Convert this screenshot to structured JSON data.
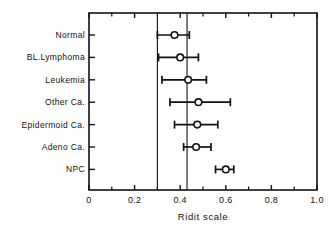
{
  "chart_data": {
    "type": "scatter",
    "title": "",
    "xlabel": "Ridit scale",
    "ylabel": "",
    "xlim": [
      0,
      1.0
    ],
    "xticks": [
      0,
      0.2,
      0.4,
      0.6,
      0.8,
      1.0
    ],
    "xtick_labels": [
      "0",
      "0.2",
      "0.4",
      "0.6",
      "0.8",
      "1.0"
    ],
    "xminor_ticks": [
      0.1,
      0.3,
      0.5,
      0.7,
      0.9
    ],
    "grid": false,
    "legend": "none",
    "frame": "box",
    "orientation": "horizontal",
    "marker": "open-circle",
    "categories": [
      "Normal",
      "BL.Lymphoma",
      "Leukemia",
      "Other Ca.",
      "Epidermoid Ca.",
      "Adeno Ca.",
      "NPC"
    ],
    "values": [
      0.375,
      0.4,
      0.435,
      0.48,
      0.475,
      0.47,
      0.6
    ],
    "ci_low": [
      0.3,
      0.305,
      0.32,
      0.355,
      0.375,
      0.415,
      0.555
    ],
    "ci_high": [
      0.44,
      0.48,
      0.515,
      0.62,
      0.565,
      0.535,
      0.635
    ],
    "reference_lines": [
      0.3,
      0.43
    ],
    "colors": {
      "line": "#121212",
      "marker_fill": "#ffffff",
      "marker_edge": "#121212",
      "reference_line": "#121212",
      "background": "#ffffff"
    }
  },
  "axis": {
    "x_title": "Ridit scale"
  }
}
